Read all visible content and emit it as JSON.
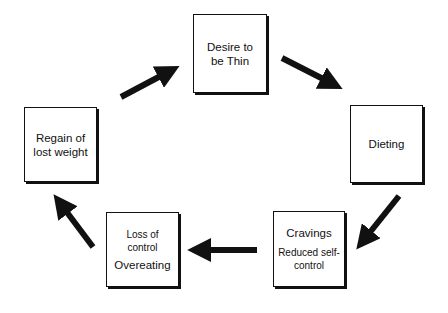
{
  "diagram": {
    "type": "cycle",
    "nodes": [
      {
        "id": "desire",
        "lines": [
          "Desire to",
          "be Thin"
        ]
      },
      {
        "id": "dieting",
        "lines": [
          "Dieting"
        ]
      },
      {
        "id": "cravings",
        "title": "Cravings",
        "subtitle": "Reduced self-control"
      },
      {
        "id": "loss",
        "title": "Loss of control",
        "subtitle": "Overeating"
      },
      {
        "id": "regain",
        "lines": [
          "Regain of",
          "lost weight"
        ]
      }
    ],
    "edges": [
      {
        "from": "desire",
        "to": "dieting"
      },
      {
        "from": "dieting",
        "to": "cravings"
      },
      {
        "from": "cravings",
        "to": "loss"
      },
      {
        "from": "loss",
        "to": "regain"
      },
      {
        "from": "regain",
        "to": "desire"
      }
    ],
    "colors": {
      "stroke": "#111111",
      "background": "#ffffff"
    }
  }
}
